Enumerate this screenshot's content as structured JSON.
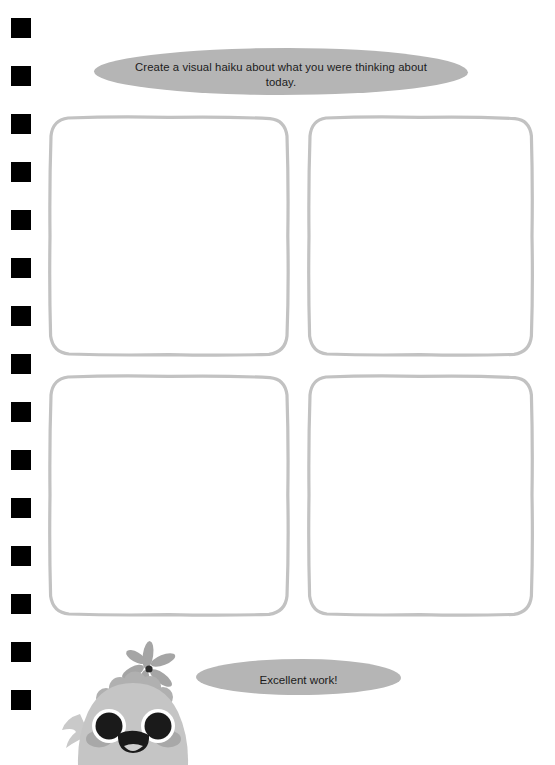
{
  "page": {
    "background_color": "#ffffff",
    "binder_holes": {
      "count": 15,
      "color": "#000000",
      "first_top": 18,
      "spacing": 48,
      "size": 20
    }
  },
  "prompt_bubble": {
    "text": "Create a visual haiku about what you were thinking about today.",
    "fill_color": "#b5b5b5",
    "text_color": "#1b1b1b"
  },
  "drawing_grid": {
    "rows": 2,
    "columns": 2,
    "border_color": "#c2c2c2",
    "fill_color": "#ffffff",
    "cells": [
      {
        "label": "panel-1",
        "content": ""
      },
      {
        "label": "panel-2",
        "content": ""
      },
      {
        "label": "panel-3",
        "content": ""
      },
      {
        "label": "panel-4",
        "content": ""
      }
    ]
  },
  "praise_bubble": {
    "text": "Excellent work!",
    "fill_color": "#b5b5b5",
    "text_color": "#1b1b1b"
  },
  "mascot": {
    "name": "gray-bird-character",
    "body_color": "#c5c5c5",
    "crest_color": "#b0b0b0",
    "cheek_color": "#a8a8a8",
    "eye_color": "#1a1a1a",
    "eye_ring_color": "#ffffff",
    "flower_petal_color": "#a5a5a5",
    "flower_center_color": "#2b2b2b",
    "stem_color": "#bdbdbd"
  }
}
